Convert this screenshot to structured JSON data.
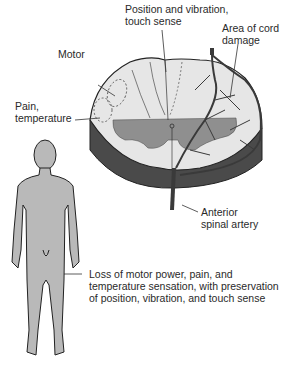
{
  "diagram": {
    "labels": {
      "position_vibration": [
        "Position and vibration,",
        "touch sense"
      ],
      "area_damage": [
        "Area of cord",
        "damage"
      ],
      "motor": "Motor",
      "pain_temp": [
        "Pain,",
        "temperature"
      ],
      "anterior_artery": [
        "Anterior",
        "spinal artery"
      ],
      "loss": [
        "Loss of motor power, pain, and",
        "temperature sensation, with preservation",
        "of position, vibration, and touch sense"
      ]
    },
    "colors": {
      "cord_white_matter": "#e6e6e6",
      "gray_matter": "#8f8f8f",
      "cord_side": "#4a4a4a",
      "body_fill": "#b9b9b9",
      "outline": "#222222",
      "artery": "#5a5a5a"
    }
  }
}
